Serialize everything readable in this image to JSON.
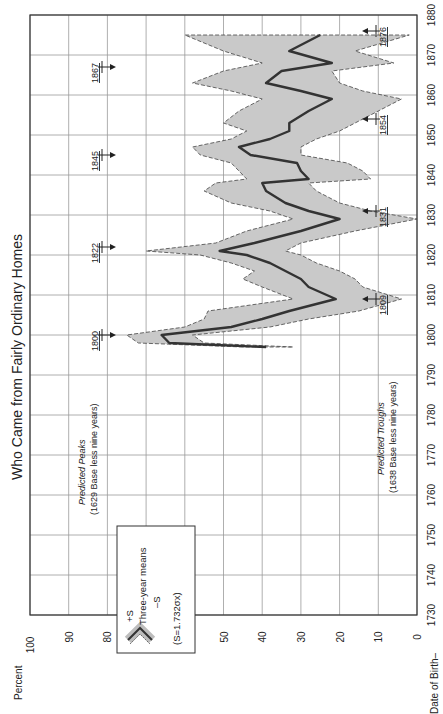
{
  "chart_data": {
    "type": "area",
    "orientation": "rotated-90-ccw",
    "title": "Who Came from Fairly Ordinary Homes",
    "xlabel": "Date of Birth",
    "ylabel": "Percent",
    "xlim": [
      1730,
      1880
    ],
    "ylim": [
      0,
      100
    ],
    "x_ticks": [
      1730,
      1740,
      1750,
      1760,
      1770,
      1780,
      1790,
      1800,
      1810,
      1820,
      1830,
      1840,
      1850,
      1860,
      1870,
      1880
    ],
    "y_ticks": [
      0,
      10,
      20,
      30,
      40,
      50,
      60,
      70,
      80,
      90,
      100
    ],
    "grid": true,
    "legend": {
      "position": "upper-left (rotated view)",
      "entries": [
        "+S",
        "Three-year means",
        "-S"
      ],
      "note": "(S=1.732σx)"
    },
    "series": [
      {
        "name": "Three-year means",
        "x": [
          1797,
          1798,
          1800,
          1802,
          1804,
          1806,
          1809,
          1812,
          1814,
          1816,
          1818,
          1820,
          1821,
          1823,
          1826,
          1829,
          1831,
          1833,
          1836,
          1838,
          1839,
          1841,
          1843,
          1845,
          1847,
          1849,
          1851,
          1853,
          1856,
          1859,
          1861,
          1863,
          1866,
          1868,
          1871,
          1875
        ],
        "values": [
          39,
          64,
          66,
          48,
          40,
          33,
          21,
          28,
          30,
          34,
          38,
          44,
          51,
          42,
          30,
          20,
          28,
          34,
          39,
          40,
          28,
          30,
          31,
          43,
          46,
          38,
          33,
          33,
          28,
          22,
          30,
          39,
          35,
          22,
          33,
          25
        ]
      },
      {
        "name": "+S",
        "x": [
          1797,
          1798,
          1800,
          1802,
          1804,
          1806,
          1809,
          1812,
          1814,
          1816,
          1818,
          1820,
          1821,
          1823,
          1826,
          1829,
          1831,
          1833,
          1836,
          1838,
          1839,
          1841,
          1843,
          1845,
          1847,
          1849,
          1851,
          1853,
          1856,
          1859,
          1861,
          1863,
          1866,
          1868,
          1871,
          1875
        ],
        "values": [
          45,
          72,
          75,
          60,
          55,
          54,
          32,
          40,
          45,
          42,
          48,
          56,
          70,
          52,
          44,
          32,
          38,
          48,
          55,
          52,
          44,
          46,
          48,
          56,
          58,
          48,
          44,
          50,
          46,
          40,
          48,
          58,
          50,
          40,
          50,
          60
        ]
      },
      {
        "name": "-S",
        "x": [
          1797,
          1798,
          1800,
          1802,
          1804,
          1806,
          1809,
          1812,
          1814,
          1816,
          1818,
          1820,
          1821,
          1823,
          1826,
          1829,
          1831,
          1833,
          1836,
          1838,
          1839,
          1841,
          1843,
          1845,
          1847,
          1849,
          1851,
          1853,
          1856,
          1859,
          1861,
          1863,
          1866,
          1868,
          1871,
          1875
        ],
        "values": [
          32,
          55,
          58,
          38,
          28,
          15,
          4,
          14,
          16,
          20,
          26,
          30,
          34,
          30,
          16,
          0,
          12,
          20,
          26,
          28,
          12,
          14,
          18,
          30,
          30,
          26,
          20,
          16,
          10,
          4,
          14,
          20,
          22,
          6,
          16,
          2
        ]
      }
    ],
    "annotations": {
      "predicted_peaks": {
        "label": "Predicted Peaks",
        "sublabel": "(1629 Base less nine years)",
        "years": [
          "1800",
          "1822",
          "1845",
          "1867"
        ]
      },
      "predicted_troughs": {
        "label": "Predicted Troughs",
        "sublabel": "(1638 Base less nine years)",
        "years": [
          "1809",
          "1831",
          "1854",
          "1876"
        ]
      }
    }
  },
  "labels": {
    "title": "Who Came from Fairly Ordinary Homes",
    "percent": "Percent",
    "date_of_birth": "Date of Birth–",
    "legend_plus": "+S",
    "legend_mean": "Three-year means",
    "legend_minus": "–S",
    "legend_note": "(S=1.732σx)",
    "peaks_title": "Predicted Peaks",
    "peaks_sub": "(1629 Base less nine years)",
    "troughs_title": "Predicted Troughs",
    "troughs_sub": "(1638 Base less nine years)"
  }
}
